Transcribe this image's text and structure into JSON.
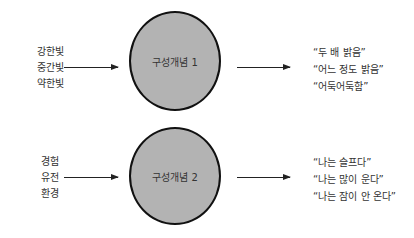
{
  "diagram": {
    "groups": [
      {
        "inputs": [
          "강한빛",
          "중간빛",
          "약한빛"
        ],
        "construct": "구성개념 1",
        "outputs": [
          "“두 배 밝음”",
          "“어느 정도 밝음”",
          "“어둑어둑함”"
        ]
      },
      {
        "inputs": [
          "경험",
          "유전",
          "환경"
        ],
        "construct": "구성개념 2",
        "outputs": [
          "“나는 슬프다”",
          "“나는 많이 운다”",
          "“나는 잠이 안 온다”"
        ]
      }
    ],
    "colors": {
      "circle_fill": "#b3b3b3",
      "circle_stroke": "#111111",
      "arrow": "#222222"
    }
  }
}
